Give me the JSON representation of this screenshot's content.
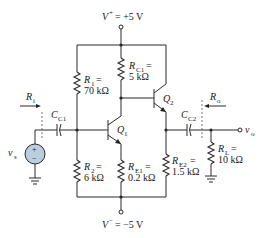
{
  "diagram": {
    "type": "circuit-schematic",
    "supplies": {
      "positive": {
        "symbol": "V",
        "sup": "+",
        "value": "= +5 V"
      },
      "negative": {
        "symbol": "V",
        "sup": "−",
        "value": "= −5 V"
      }
    },
    "resistors": {
      "R1": {
        "name": "R",
        "sub": "1",
        "value_line1": "=",
        "value_line2": "70 kΩ"
      },
      "R2": {
        "name": "R",
        "sub": "2",
        "value_line1": "=",
        "value_line2": "6 kΩ"
      },
      "RC1": {
        "name": "R",
        "sub": "C1",
        "value_line1": "=",
        "value_line2": "5 kΩ"
      },
      "RE1": {
        "name": "R",
        "sub": "E1",
        "value_line1": "=",
        "value_line2": "0.2 kΩ"
      },
      "RE2": {
        "name": "R",
        "sub": "E2",
        "value_line1": "=",
        "value_line2": "1.5 kΩ"
      },
      "RL": {
        "name": "R",
        "sub": "L",
        "value_line1": "=",
        "value_line2": "10 kΩ"
      }
    },
    "capacitors": {
      "CC1": {
        "name": "C",
        "sub": "C1"
      },
      "CC2": {
        "name": "C",
        "sub": "C2"
      }
    },
    "transistors": {
      "Q1": {
        "name": "Q",
        "sub": "1"
      },
      "Q2": {
        "name": "Q",
        "sub": "2"
      }
    },
    "source": {
      "name": "v",
      "sub": "s",
      "plus": "+",
      "minus": "−",
      "fill_color": "#b9cfe0"
    },
    "ports": {
      "Ri": {
        "name": "R",
        "sub": "i"
      },
      "Ro": {
        "name": "R",
        "sub": "o"
      },
      "vo": {
        "name": "v",
        "sub": "o"
      }
    }
  }
}
